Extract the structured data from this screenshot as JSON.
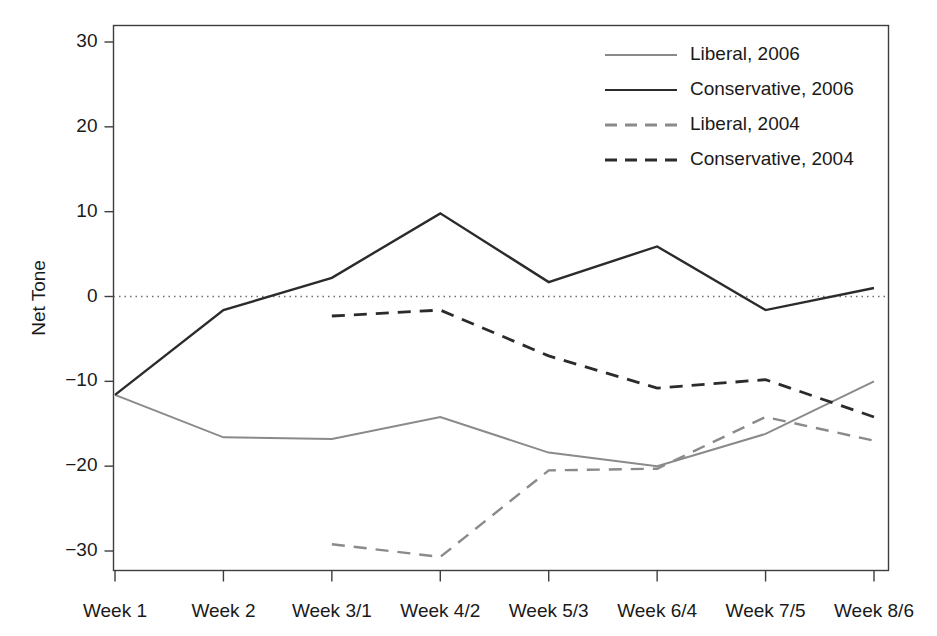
{
  "chart_data": {
    "type": "line",
    "title": "",
    "xlabel": "",
    "ylabel": "Net Tone",
    "categories": [
      "Week 1",
      "Week 2",
      "Week 3/1",
      "Week 4/2",
      "Week 5/3",
      "Week 6/4",
      "Week 7/5",
      "Week 8/6"
    ],
    "ylim": [
      -33,
      32
    ],
    "yticks": [
      30,
      20,
      10,
      0,
      -10,
      -20,
      -30
    ],
    "ytick_labels": [
      "30",
      "20",
      "10",
      "0",
      "−10",
      "−20",
      "−30"
    ],
    "grid": false,
    "zero_reference_line": true,
    "legend_position": "top-right",
    "series": [
      {
        "name": "Liberal, 2006",
        "style": "solid",
        "color": "#8a8a8a",
        "width": 2.0,
        "x": [
          "Week 1",
          "Week 2",
          "Week 3/1",
          "Week 4/2",
          "Week 5/3",
          "Week 6/4",
          "Week 7/5",
          "Week 8/6"
        ],
        "values": [
          -11.6,
          -16.6,
          -16.8,
          -14.2,
          -18.4,
          -20.0,
          -16.2,
          -10.0
        ]
      },
      {
        "name": "Conservative, 2006",
        "style": "solid",
        "color": "#2b2b2b",
        "width": 2.4,
        "x": [
          "Week 1",
          "Week 2",
          "Week 3/1",
          "Week 4/2",
          "Week 5/3",
          "Week 6/4",
          "Week 7/5",
          "Week 8/6"
        ],
        "values": [
          -11.6,
          -1.6,
          2.2,
          9.8,
          1.7,
          5.9,
          -1.6,
          1.0
        ]
      },
      {
        "name": "Liberal, 2004",
        "style": "dashed",
        "color": "#8a8a8a",
        "width": 2.4,
        "x": [
          "Week 3/1",
          "Week 4/2",
          "Week 5/3",
          "Week 6/4",
          "Week 7/5",
          "Week 8/6"
        ],
        "values": [
          -29.2,
          -30.7,
          -20.5,
          -20.3,
          -14.2,
          -17.0
        ]
      },
      {
        "name": "Conservative, 2004",
        "style": "dashed",
        "color": "#2b2b2b",
        "width": 2.8,
        "x": [
          "Week 3/1",
          "Week 4/2",
          "Week 5/3",
          "Week 6/4",
          "Week 7/5",
          "Week 8/6"
        ],
        "values": [
          -2.3,
          -1.6,
          -7.0,
          -10.8,
          -9.8,
          -14.2
        ]
      }
    ],
    "legend_entries": [
      {
        "label": "Liberal, 2006",
        "style": "solid",
        "color": "#8a8a8a"
      },
      {
        "label": "Conservative, 2006",
        "style": "solid",
        "color": "#2b2b2b"
      },
      {
        "label": "Liberal, 2004",
        "style": "dashed",
        "color": "#8a8a8a"
      },
      {
        "label": "Conservative, 2004",
        "style": "dashed",
        "color": "#2b2b2b"
      }
    ]
  },
  "axis": {
    "y_title": "Net Tone"
  },
  "colors": {
    "liberal": "#8a8a8a",
    "conservative": "#2b2b2b",
    "frame": "#3d3d3d",
    "zero_line": "#6e6e6e",
    "background": "#ffffff"
  }
}
